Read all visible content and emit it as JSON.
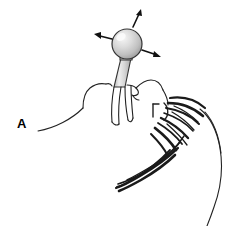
{
  "figure": {
    "panel_label": "A",
    "background_color": "#ffffff",
    "ink_color": "#222222",
    "type": "line-drawing-illustration",
    "parts": {
      "sphere_label": "ball",
      "stem_label": "mouthpiece stem",
      "head_label": "head in profile",
      "hair_label": "hair",
      "ear_label": "ear",
      "shoulder_label": "shoulder",
      "neck_label": "neck"
    },
    "sphere": {
      "center_x": 127,
      "center_y": 44,
      "radius": 15,
      "fill_light": "#f2f2f2",
      "fill_mid": "#d4d4d4",
      "fill_dark": "#a8a8a8",
      "outline": "#333333"
    },
    "stem": {
      "fill_light": "#f0f0f0",
      "fill_dark": "#bdbdbd",
      "outline": "#333333"
    },
    "arrows": [
      {
        "name": "arrow-up",
        "direction": "up-right",
        "x1": 132,
        "y1": 28,
        "x2": 141,
        "y2": 11
      },
      {
        "name": "arrow-left",
        "direction": "left-up",
        "x1": 111,
        "y1": 40,
        "x2": 95,
        "y2": 36
      },
      {
        "name": "arrow-right",
        "direction": "right-down",
        "x1": 143,
        "y1": 50,
        "x2": 160,
        "y2": 56
      }
    ]
  }
}
